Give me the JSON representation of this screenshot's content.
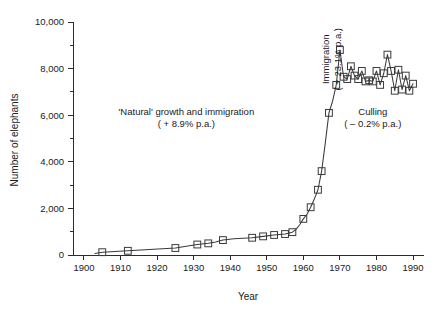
{
  "chart_data": {
    "type": "line",
    "title": "",
    "xlabel": "Year",
    "ylabel": "Number of elephants",
    "xlim": [
      1897,
      1993
    ],
    "ylim": [
      0,
      10000
    ],
    "grid": false,
    "legend": null,
    "xticks": [
      1900,
      1910,
      1920,
      1930,
      1940,
      1950,
      1960,
      1970,
      1980,
      1990
    ],
    "xtick_labels": [
      "1900",
      "1910",
      "1920",
      "1930",
      "1940",
      "1950",
      "1960",
      "1970",
      "1980",
      "1990"
    ],
    "yticks": [
      0,
      2000,
      4000,
      6000,
      8000,
      10000
    ],
    "ytick_labels": [
      "0",
      "2,000",
      "4,000",
      "6,000",
      "8,000",
      "10,000"
    ],
    "yticks_minor": [
      1000,
      3000,
      5000,
      7000,
      9000
    ],
    "marker": "open-square",
    "series": [
      {
        "name": "Number of elephants",
        "x": [
          1903,
          1905,
          1912,
          1925,
          1931,
          1934,
          1936,
          1938,
          1941,
          1946,
          1949,
          1952,
          1955,
          1957,
          1958,
          1959,
          1960,
          1961,
          1962,
          1963,
          1964,
          1965,
          1966,
          1967,
          1968,
          1969,
          1970,
          1971,
          1972,
          1973,
          1974,
          1975,
          1976,
          1977,
          1978,
          1979,
          1980,
          1981,
          1982,
          1983,
          1984,
          1985,
          1986,
          1987,
          1988,
          1989,
          1990
        ],
        "values": [
          60,
          120,
          180,
          300,
          450,
          500,
          560,
          640,
          700,
          740,
          800,
          860,
          900,
          980,
          1100,
          1300,
          1550,
          1750,
          2050,
          2400,
          2800,
          3600,
          4800,
          6100,
          6600,
          7300,
          8800,
          7650,
          7550,
          8100,
          7700,
          7550,
          7900,
          7450,
          7500,
          7450,
          7900,
          7300,
          7800,
          8600,
          7900,
          7050,
          7950,
          7100,
          7700,
          7050,
          7350
        ]
      }
    ],
    "annotations": [
      {
        "id": "natural-growth",
        "line1": "'Natural' growth and immigration",
        "line2": "( + 8.9% p.a.)",
        "x": 1928,
        "y": 6000,
        "rotation": 0
      },
      {
        "id": "immigration",
        "line1": "Immigration",
        "line2": "( + 23.1% p.a.)",
        "x": 1967,
        "y": 8400,
        "rotation": -90
      },
      {
        "id": "culling",
        "line1": "Culling",
        "line2": "( – 0.2% p.a.)",
        "x": 1979,
        "y": 6000,
        "rotation": 0
      }
    ]
  }
}
